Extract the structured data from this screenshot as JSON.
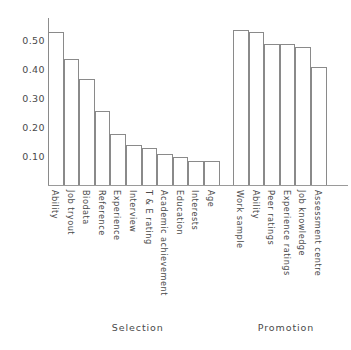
{
  "chart_data": {
    "type": "bar",
    "title": "",
    "xlabel": "",
    "ylabel": "",
    "ylim": [
      0,
      0.58
    ],
    "grid": false,
    "legend": null,
    "ytick_labels": [
      "0.50",
      "0.40",
      "0.30",
      "0.20",
      "0.10"
    ],
    "ytick_values": [
      0.5,
      0.4,
      0.3,
      0.2,
      0.1
    ],
    "groups": [
      {
        "caption": "Selection",
        "categories": [
          "Ability",
          "Job tryout",
          "Biodata",
          "Reference",
          "Experience",
          "Interview",
          "T & E rating",
          "Academic achievement",
          "Education",
          "Interests",
          "Age"
        ],
        "values": [
          0.53,
          0.44,
          0.37,
          0.26,
          0.18,
          0.14,
          0.13,
          0.11,
          0.1,
          0.085,
          0.085
        ]
      },
      {
        "caption": "Promotion",
        "categories": [
          "Work sample",
          "Ability",
          "Peer ratings",
          "Experience ratings",
          "Job knowledge",
          "Assessment centre"
        ],
        "values": [
          0.54,
          0.53,
          0.49,
          0.49,
          0.48,
          0.41
        ]
      }
    ]
  },
  "colors": {
    "bar_stroke": "#8a8a8a",
    "bar_fill": "#ffffff",
    "axis": "#8d8d8d",
    "text": "#4a4a4a",
    "background": "#ffffff"
  }
}
